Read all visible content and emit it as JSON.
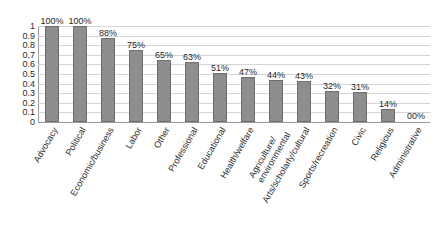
{
  "chart_data": {
    "type": "bar",
    "title": "",
    "subtitle": "",
    "xlabel": "",
    "ylabel": "",
    "ylim": [
      0,
      1
    ],
    "grid": true,
    "legend": false,
    "orientation": "vertical",
    "bar_color": "#8d8d8d",
    "bar_border_color": "#6e6e6e",
    "gridline_color": "#d4d4d4",
    "axis_color": "#9a9a9a",
    "label_color": "#262626",
    "categories": [
      "Advocacy",
      "Political",
      "Economic/business",
      "Labor",
      "Other",
      "Professional",
      "Educational",
      "Health/welfare",
      "Agriculture/\nenvironmental",
      "Arts/scholarly/cultural",
      "Sports/recreation",
      "Civic",
      "Religious",
      "Administrative"
    ],
    "values": [
      1.0,
      1.0,
      0.88,
      0.75,
      0.65,
      0.63,
      0.51,
      0.47,
      0.44,
      0.43,
      0.32,
      0.31,
      0.14,
      0.0
    ],
    "data_labels": [
      "100%",
      "100%",
      "88%",
      "75%",
      "65%",
      "63%",
      "51%",
      "47%",
      "44%",
      "43%",
      "32%",
      "31%",
      "14%",
      "00%"
    ],
    "ytick_values": [
      1,
      0.9,
      0.8,
      0.7,
      0.6,
      0.5,
      0.4,
      0.3,
      0.2,
      0.1,
      0
    ],
    "ytick_labels": [
      "1",
      "0.9",
      "0.8",
      "0.7",
      "0.6",
      "0.5",
      "0.4",
      "0.3",
      "0.2",
      "0.1",
      "0"
    ]
  }
}
